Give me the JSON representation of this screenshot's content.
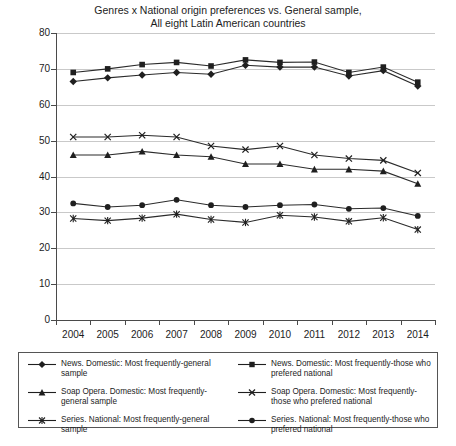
{
  "chart_data": {
    "type": "line",
    "title": "Genres x National origin preferences vs. General sample, All eight Latin American countries",
    "title_line1": "Genres x National origin preferences vs. General sample,",
    "title_line2": "All eight Latin American countries",
    "xlabel": "",
    "ylabel": "",
    "grid": true,
    "legend_position": "bottom",
    "ylim": [
      0,
      80
    ],
    "yticks": [
      0,
      10,
      20,
      30,
      40,
      50,
      60,
      70,
      80
    ],
    "categories": [
      "2004",
      "2005",
      "2006",
      "2007",
      "2008",
      "2009",
      "2010",
      "2011",
      "2012",
      "2013",
      "2014"
    ],
    "series": [
      {
        "name": "News. Domestic: Most frequently-general sample",
        "marker": "diamond",
        "values": [
          66.5,
          67.5,
          68.3,
          69.0,
          68.5,
          71.0,
          70.5,
          70.5,
          68.0,
          69.5,
          65.2
        ]
      },
      {
        "name": "News. Domestic: Most frequently-those who prefered national",
        "marker": "square",
        "values": [
          69.0,
          70.0,
          71.2,
          71.8,
          70.8,
          72.5,
          71.8,
          71.9,
          69.0,
          70.5,
          66.3
        ]
      },
      {
        "name": "Soap Opera. Domestic: Most frequently-general sample",
        "marker": "triangle",
        "values": [
          46.0,
          46.0,
          47.0,
          46.0,
          45.5,
          43.5,
          43.5,
          42.0,
          42.0,
          41.5,
          38.0
        ]
      },
      {
        "name": "Soap Opera. Domestic: Most frequently-those who prefered national",
        "marker": "cross",
        "values": [
          51.0,
          51.0,
          51.5,
          51.0,
          48.5,
          47.5,
          48.5,
          46.0,
          45.0,
          44.5,
          41.0
        ]
      },
      {
        "name": "Series. National: Most frequently-general sample",
        "marker": "asterisk",
        "values": [
          28.3,
          27.7,
          28.4,
          29.5,
          28.0,
          27.2,
          29.2,
          28.7,
          27.5,
          28.5,
          25.2
        ]
      },
      {
        "name": "Series. National: Most frequently-those who prefered national",
        "marker": "circle",
        "values": [
          32.5,
          31.5,
          32.0,
          33.5,
          32.0,
          31.5,
          32.0,
          32.2,
          31.0,
          31.2,
          29.0
        ]
      }
    ]
  },
  "legend": {
    "entries": [
      {
        "label": "News. Domestic: Most frequently-general sample",
        "marker": "diamond"
      },
      {
        "label": "News. Domestic: Most frequently-those who prefered national",
        "marker": "square"
      },
      {
        "label": "Soap Opera. Domestic: Most frequently-general sample",
        "marker": "triangle"
      },
      {
        "label": "Soap Opera. Domestic: Most frequently-those who prefered national",
        "marker": "cross"
      },
      {
        "label": "Series. National: Most frequently-general sample",
        "marker": "asterisk"
      },
      {
        "label": "Series. National: Most frequently-those who prefered national",
        "marker": "circle"
      }
    ]
  },
  "colors": {
    "line": "#2b2b2b",
    "grid": "#c9c9c9",
    "axis": "#4a4a4a",
    "text": "#1c1c1c"
  }
}
